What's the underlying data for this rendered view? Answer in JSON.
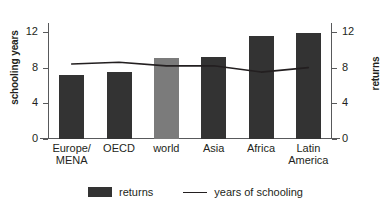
{
  "chart_data": {
    "type": "bar",
    "title": "",
    "xlabel": "",
    "ylabel": "schooling years",
    "y2label": "returns",
    "categories": [
      "Europe/\nMENA",
      "OECD",
      "world",
      "Asia",
      "Africa",
      "Latin\nAmerica"
    ],
    "ylim": [
      0,
      13
    ],
    "y2lim": [
      0,
      13
    ],
    "yticks": [
      "0",
      "4",
      "8",
      "12"
    ],
    "ytick_values": [
      0,
      4,
      8,
      12
    ],
    "y2ticks": [
      "0",
      "4",
      "8",
      "12"
    ],
    "y2tick_values": [
      0,
      4,
      8,
      12
    ],
    "grid": false,
    "legend_position": "bottom",
    "series": [
      {
        "name": "returns",
        "type": "bar",
        "axis": "right",
        "color": "#333333",
        "highlight_color": "#7b7b7b",
        "highlight_index": 2,
        "values": [
          7.2,
          7.5,
          9.1,
          9.2,
          11.6,
          11.9
        ]
      },
      {
        "name": "years of schooling",
        "type": "line",
        "axis": "left",
        "color": "#231f20",
        "values": [
          8.4,
          8.6,
          8.2,
          8.2,
          7.5,
          8.0
        ]
      }
    ]
  },
  "legend": {
    "items": [
      {
        "label": "returns",
        "marker": "bar-swatch"
      },
      {
        "label": "years of schooling",
        "marker": "line-swatch"
      }
    ]
  }
}
